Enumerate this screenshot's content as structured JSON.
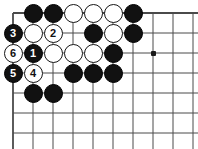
{
  "figure": {
    "kind": "go-board-diagram",
    "width": 198,
    "height": 149,
    "background_color": "#ffffff",
    "line_color": "#4a4a4a",
    "black_color": "#111111",
    "white_color": "#ffffff",
    "stone_outline_color": "#151515"
  },
  "board": {
    "columns": 10,
    "rows": 8,
    "origin_x": 13,
    "origin_y": 13,
    "cell_size": 20,
    "edge_top": true,
    "edge_left": true,
    "edge_right": false,
    "edge_bottom": false,
    "star_points": [
      {
        "col": 8,
        "row": 3
      }
    ]
  },
  "stones": [
    {
      "col": 2,
      "row": 1,
      "color": "black",
      "label": ""
    },
    {
      "col": 3,
      "row": 1,
      "color": "black",
      "label": ""
    },
    {
      "col": 4,
      "row": 1,
      "color": "white",
      "label": ""
    },
    {
      "col": 5,
      "row": 1,
      "color": "white",
      "label": ""
    },
    {
      "col": 6,
      "row": 1,
      "color": "white",
      "label": ""
    },
    {
      "col": 7,
      "row": 1,
      "color": "black",
      "label": ""
    },
    {
      "col": 1,
      "row": 2,
      "color": "black",
      "label": "3"
    },
    {
      "col": 2,
      "row": 2,
      "color": "white",
      "label": ""
    },
    {
      "col": 3,
      "row": 2,
      "color": "white",
      "label": "2"
    },
    {
      "col": 5,
      "row": 2,
      "color": "black",
      "label": ""
    },
    {
      "col": 6,
      "row": 2,
      "color": "white",
      "label": ""
    },
    {
      "col": 7,
      "row": 2,
      "color": "black",
      "label": ""
    },
    {
      "col": 1,
      "row": 3,
      "color": "white",
      "label": "6"
    },
    {
      "col": 2,
      "row": 3,
      "color": "black",
      "label": "1"
    },
    {
      "col": 3,
      "row": 3,
      "color": "white",
      "label": ""
    },
    {
      "col": 4,
      "row": 3,
      "color": "white",
      "label": ""
    },
    {
      "col": 5,
      "row": 3,
      "color": "white",
      "label": ""
    },
    {
      "col": 6,
      "row": 3,
      "color": "black",
      "label": ""
    },
    {
      "col": 1,
      "row": 4,
      "color": "black",
      "label": "5"
    },
    {
      "col": 2,
      "row": 4,
      "color": "white",
      "label": "4"
    },
    {
      "col": 4,
      "row": 4,
      "color": "black",
      "label": ""
    },
    {
      "col": 5,
      "row": 4,
      "color": "black",
      "label": ""
    },
    {
      "col": 6,
      "row": 4,
      "color": "black",
      "label": ""
    },
    {
      "col": 2,
      "row": 5,
      "color": "black",
      "label": ""
    },
    {
      "col": 3,
      "row": 5,
      "color": "black",
      "label": ""
    }
  ],
  "move_sequence": [
    {
      "number": "1",
      "color": "black",
      "col": 2,
      "row": 3
    },
    {
      "number": "2",
      "color": "white",
      "col": 3,
      "row": 2
    },
    {
      "number": "3",
      "color": "black",
      "col": 1,
      "row": 2
    },
    {
      "number": "4",
      "color": "white",
      "col": 2,
      "row": 4
    },
    {
      "number": "5",
      "color": "black",
      "col": 1,
      "row": 4
    },
    {
      "number": "6",
      "color": "white",
      "col": 1,
      "row": 3
    }
  ]
}
